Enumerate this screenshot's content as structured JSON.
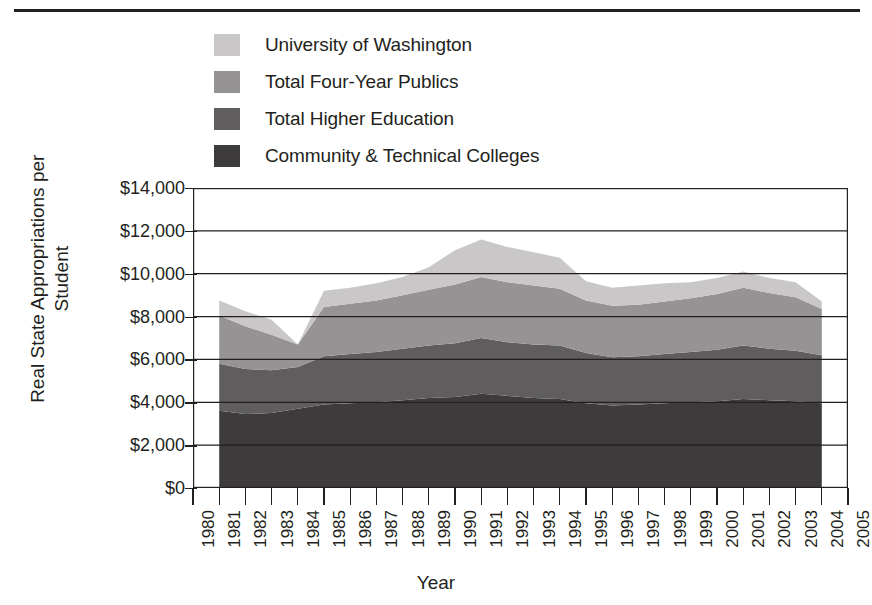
{
  "chart_data": {
    "type": "area",
    "stacked": true,
    "title": "",
    "xlabel": "Year",
    "ylabel": "Real State Appropriations per Student",
    "ylim": [
      0,
      14000
    ],
    "ytick_values": [
      0,
      2000,
      4000,
      6000,
      8000,
      10000,
      12000,
      14000
    ],
    "ytick_labels": [
      "$0",
      "$2,000",
      "$4,000",
      "$6,000",
      "$8,000",
      "$10,000",
      "$12,000",
      "$14,000"
    ],
    "xlim": [
      1980,
      2005
    ],
    "xtick_labels": [
      "1980",
      "1981",
      "1982",
      "1983",
      "1984",
      "1985",
      "1986",
      "1987",
      "1988",
      "1989",
      "1990",
      "1991",
      "1992",
      "1993",
      "1994",
      "1995",
      "1996",
      "1997",
      "1998",
      "1999",
      "2000",
      "2001",
      "2002",
      "2003",
      "2004",
      "2005"
    ],
    "grid": true,
    "grid_axis": "y",
    "legend_position": "top-left",
    "x": [
      1981,
      1982,
      1983,
      1984,
      1985,
      1986,
      1987,
      1988,
      1989,
      1990,
      1991,
      1992,
      1993,
      1994,
      1995,
      1996,
      1997,
      1998,
      1999,
      2000,
      2001,
      2002,
      2003,
      2004
    ],
    "series": [
      {
        "name": "Community & Technical Colleges",
        "color": "#3d3b3c",
        "values": [
          3600,
          3450,
          3500,
          3700,
          3900,
          3950,
          4000,
          4100,
          4200,
          4250,
          4400,
          4300,
          4200,
          4150,
          3950,
          3850,
          3900,
          3950,
          4000,
          4050,
          4150,
          4100,
          4050,
          3950
        ]
      },
      {
        "name": "Total Higher Education",
        "color": "#5f5d5e",
        "values": [
          2200,
          2100,
          2000,
          1950,
          2250,
          2300,
          2350,
          2400,
          2450,
          2500,
          2600,
          2500,
          2500,
          2500,
          2350,
          2250,
          2250,
          2300,
          2350,
          2400,
          2500,
          2400,
          2350,
          2250
        ]
      },
      {
        "name": "Total Four-Year Publics",
        "color": "#969394",
        "values": [
          2250,
          2000,
          1650,
          1050,
          2300,
          2350,
          2400,
          2500,
          2600,
          2750,
          2850,
          2800,
          2750,
          2650,
          2450,
          2400,
          2400,
          2450,
          2500,
          2600,
          2700,
          2600,
          2500,
          2150
        ]
      },
      {
        "name": "University of Washington",
        "color": "#c9c7c8",
        "values": [
          700,
          700,
          700,
          0,
          750,
          750,
          800,
          850,
          1050,
          1600,
          1750,
          1650,
          1550,
          1450,
          900,
          850,
          900,
          850,
          750,
          750,
          750,
          700,
          700,
          350
        ]
      }
    ]
  },
  "legend": {
    "items": [
      {
        "label": "University of Washington",
        "color": "#c9c7c8"
      },
      {
        "label": "Total Four-Year Publics",
        "color": "#969394"
      },
      {
        "label": "Total Higher Education",
        "color": "#5f5d5e"
      },
      {
        "label": "Community & Technical Colleges",
        "color": "#3d3b3c"
      }
    ]
  },
  "axes": {
    "ylabel": "Real State Appropriations per Student",
    "xlabel": "Year"
  }
}
